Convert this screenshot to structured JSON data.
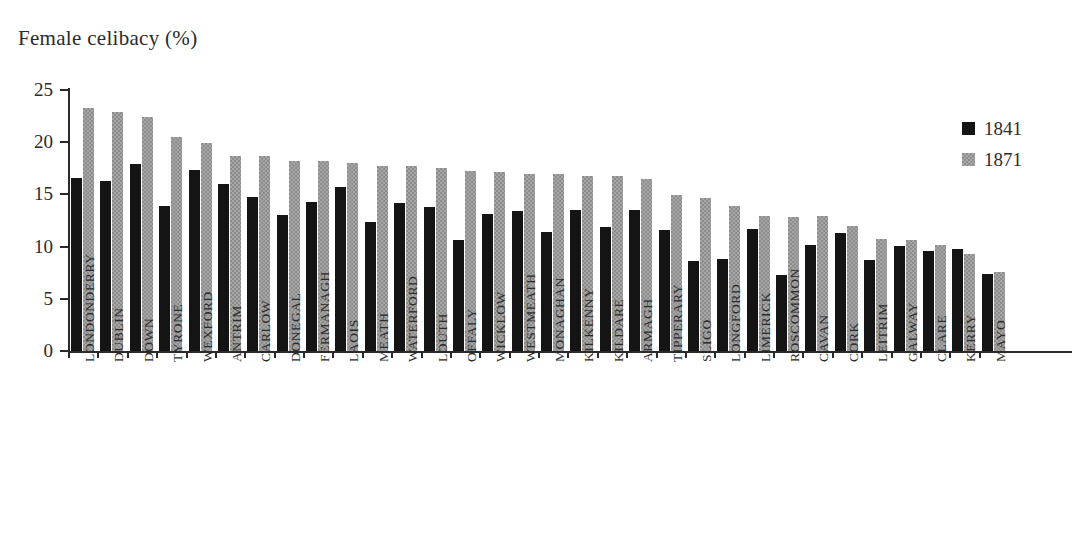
{
  "chart_data": {
    "type": "bar",
    "title": "Female celibacy (%)",
    "xlabel": "",
    "ylabel": "",
    "ylim": [
      0,
      25
    ],
    "yticks": [
      0,
      5,
      10,
      15,
      20,
      25
    ],
    "grid": false,
    "legend_position": "top-right",
    "categories": [
      "LONDONDERRY",
      "DUBLIN",
      "DOWN",
      "TYRONE",
      "WEXFORD",
      "ANTRIM",
      "CARLOW",
      "DONEGAL",
      "FERMANAGH",
      "LAOIS",
      "MEATH",
      "WATERFORD",
      "LOUTH",
      "OFFALY",
      "WICKLOW",
      "WESTMEATH",
      "MONAGHAN",
      "KILKENNY",
      "KILDARE",
      "ARMAGH",
      "TIPPERARY",
      "SLIGO",
      "LONGFORD",
      "LIMERICK",
      "ROSCOMMON",
      "CAVAN",
      "CORK",
      "LEITRIM",
      "GALWAY",
      "CLARE",
      "KERRY",
      "MAYO"
    ],
    "series": [
      {
        "name": "1841",
        "color": "#141414",
        "values": [
          16.6,
          16.3,
          17.9,
          13.9,
          17.3,
          16.0,
          14.8,
          13.0,
          14.3,
          15.7,
          12.4,
          14.2,
          13.8,
          10.6,
          13.1,
          13.4,
          11.4,
          13.5,
          11.9,
          13.5,
          11.6,
          8.6,
          8.8,
          11.7,
          7.3,
          10.2,
          11.3,
          8.7,
          10.1,
          9.6,
          9.8,
          7.4
        ]
      },
      {
        "name": "1871",
        "color": "#8d8d8d",
        "values": [
          23.3,
          22.9,
          22.4,
          20.5,
          19.9,
          18.7,
          18.7,
          18.2,
          18.2,
          18.0,
          17.7,
          17.7,
          17.5,
          17.2,
          17.1,
          17.0,
          17.0,
          16.8,
          16.8,
          16.5,
          14.9,
          14.7,
          13.9,
          12.9,
          12.8,
          12.9,
          12.0,
          10.7,
          10.6,
          10.2,
          9.3,
          7.6
        ]
      }
    ]
  }
}
